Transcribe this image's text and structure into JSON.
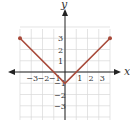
{
  "chart_data": {
    "type": "line",
    "title": "",
    "xlabel": "x",
    "ylabel": "y",
    "xlim": [
      -4,
      4
    ],
    "ylim": [
      -4,
      4
    ],
    "grid": true,
    "x_ticks": [
      "-3",
      "-2",
      "-1",
      "1",
      "2",
      "3"
    ],
    "y_ticks": [
      "3",
      "2",
      "1",
      "-1",
      "-2",
      "-3"
    ],
    "series": [
      {
        "name": "y = |x| - 1",
        "x": [
          -4,
          0,
          4
        ],
        "y": [
          3,
          -1,
          3
        ],
        "color": "#a84a3a",
        "endpoints": "closed"
      }
    ]
  },
  "colors": {
    "curve": "#a84a3a",
    "axis": "#222222",
    "grid": "#d9d9d9"
  }
}
